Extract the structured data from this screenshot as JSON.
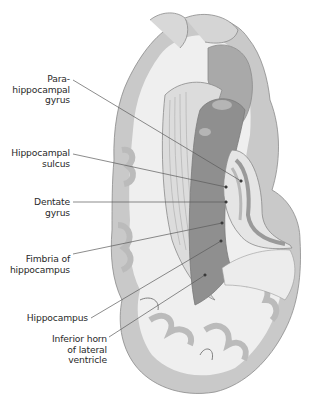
{
  "figure": {
    "colors": {
      "background": "#ffffff",
      "white_matter": "#efefef",
      "gray_matter": "#c9c9c9",
      "outline": "#8a8a8a",
      "hippocampus_dark": "#8f8f8f",
      "hippocampus_mid": "#a9a9a9",
      "leader_line": "#5a5a5a",
      "label_text": "#2a2a2a"
    },
    "labels": [
      {
        "id": "parahippocampal-gyrus",
        "lines": [
          "Para-",
          "hippocampal",
          "gyrus"
        ]
      },
      {
        "id": "hippocampal-sulcus",
        "lines": [
          "Hippocampal",
          "sulcus"
        ]
      },
      {
        "id": "dentate-gyrus",
        "lines": [
          "Dentate",
          "gyrus"
        ]
      },
      {
        "id": "fimbria-of-hippocampus",
        "lines": [
          "Fimbria of",
          "hippocampus"
        ]
      },
      {
        "id": "hippocampus",
        "lines": [
          "Hippocampus"
        ]
      },
      {
        "id": "inferior-horn",
        "lines": [
          "Inferior horn",
          "of lateral",
          "ventricle"
        ]
      }
    ],
    "caption": ""
  }
}
